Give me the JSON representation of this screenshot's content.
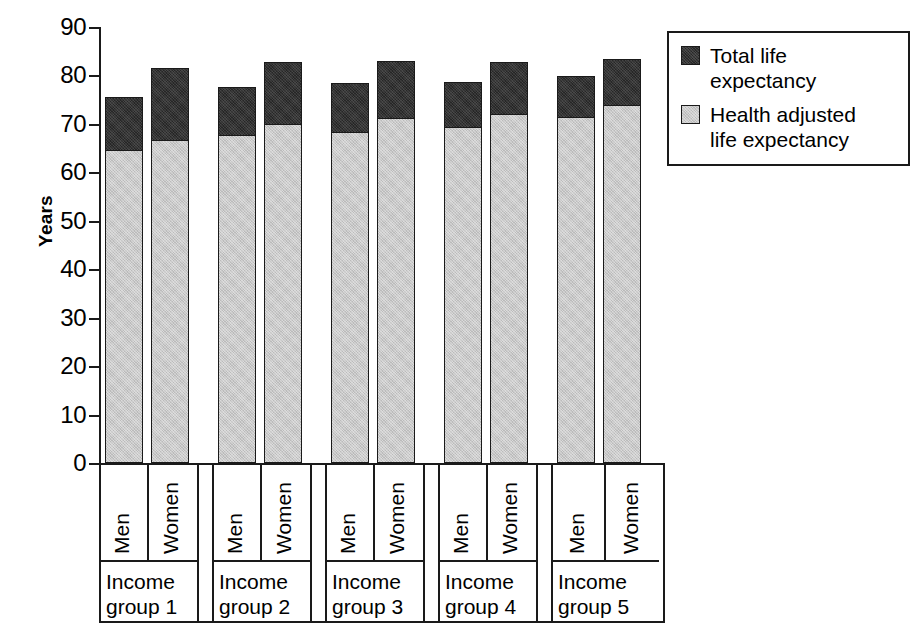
{
  "chart_data": {
    "type": "bar",
    "subtype": "stacked-bar-grouped",
    "title": "",
    "xlabel": "",
    "ylabel": "Years",
    "ylim": [
      0,
      90
    ],
    "yticks": [
      0,
      10,
      20,
      30,
      40,
      50,
      60,
      70,
      80,
      90
    ],
    "grid": false,
    "legend_position": "top-right",
    "categories": [
      "Income group 1",
      "Income group 2",
      "Income group 3",
      "Income group 4",
      "Income group 5"
    ],
    "subcategories": [
      "Men",
      "Women"
    ],
    "series": [
      {
        "name": "Health adjusted life expectancy",
        "color": "#c9c9c9",
        "values": {
          "Men": [
            64.8,
            68.0,
            68.6,
            69.6,
            71.6
          ],
          "Women": [
            66.8,
            70.2,
            71.4,
            72.3,
            74.2
          ]
        }
      },
      {
        "name": "Total life expectancy",
        "color": "#333333",
        "values": {
          "Men": [
            75.5,
            77.7,
            78.5,
            78.6,
            79.8
          ],
          "Women": [
            81.6,
            82.7,
            83.0,
            82.8,
            83.4
          ]
        }
      }
    ],
    "bars": [
      {
        "group": "Income group 1",
        "sex": "Men",
        "hale": 64.8,
        "total": 75.5
      },
      {
        "group": "Income group 1",
        "sex": "Women",
        "hale": 66.8,
        "total": 81.6
      },
      {
        "group": "Income group 2",
        "sex": "Men",
        "hale": 68.0,
        "total": 77.7
      },
      {
        "group": "Income group 2",
        "sex": "Women",
        "hale": 70.2,
        "total": 82.7
      },
      {
        "group": "Income group 3",
        "sex": "Men",
        "hale": 68.6,
        "total": 78.5
      },
      {
        "group": "Income group 3",
        "sex": "Women",
        "hale": 71.4,
        "total": 83.0
      },
      {
        "group": "Income group 4",
        "sex": "Men",
        "hale": 69.6,
        "total": 78.6
      },
      {
        "group": "Income group 4",
        "sex": "Women",
        "hale": 72.3,
        "total": 82.8
      },
      {
        "group": "Income group 5",
        "sex": "Men",
        "hale": 71.6,
        "total": 79.8
      },
      {
        "group": "Income group 5",
        "sex": "Women",
        "hale": 74.2,
        "total": 83.4
      }
    ]
  },
  "axis": {
    "y_title": "Years",
    "y_tick_labels": [
      "90",
      "80",
      "70",
      "60",
      "50",
      "40",
      "30",
      "20",
      "10",
      "0"
    ]
  },
  "x_groups": [
    {
      "sex_men": "Men",
      "sex_women": "Women",
      "group_line1": "Income",
      "group_line2": "group 1"
    },
    {
      "sex_men": "Men",
      "sex_women": "Women",
      "group_line1": "Income",
      "group_line2": "group 2"
    },
    {
      "sex_men": "Men",
      "sex_women": "Women",
      "group_line1": "Income",
      "group_line2": "group 3"
    },
    {
      "sex_men": "Men",
      "sex_women": "Women",
      "group_line1": "Income",
      "group_line2": "group 4"
    },
    {
      "sex_men": "Men",
      "sex_women": "Women",
      "group_line1": "Income",
      "group_line2": "group 5"
    }
  ],
  "legend": {
    "items": [
      {
        "label": "Total life expectancy",
        "swatch": "dark-hatched-swatch",
        "color": "#333333"
      },
      {
        "label": "Health adjusted\nlife expectancy",
        "swatch": "light-gray-swatch",
        "color": "#c9c9c9"
      }
    ]
  }
}
